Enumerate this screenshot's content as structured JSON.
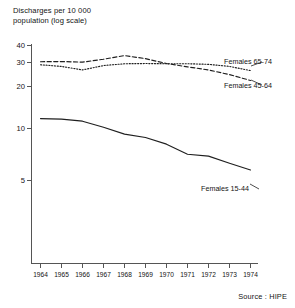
{
  "chart_data": {
    "type": "line",
    "title_line1": "Discharges per 10 000",
    "title_line2": "population (log scale)",
    "xlabel": "",
    "ylabel": "Discharges per 10 000 population (log scale)",
    "yscale": "log",
    "ylim": [
      3.2,
      45
    ],
    "ytick_labels": [
      "40",
      "30",
      "20",
      "10",
      "5"
    ],
    "ytick_values": [
      40,
      30,
      20,
      10,
      5
    ],
    "grid": false,
    "legend_position": "right-inline",
    "x": [
      1964,
      1965,
      1966,
      1967,
      1968,
      1969,
      1970,
      1971,
      1972,
      1973,
      1974
    ],
    "categories": [
      "1964",
      "1965",
      "1966",
      "1967",
      "1968",
      "1969",
      "1970",
      "1971",
      "1972",
      "1973",
      "1974"
    ],
    "series": [
      {
        "name": "Females 65-74",
        "style": "dotted",
        "values": [
          29.0,
          28.2,
          26.6,
          28.6,
          29.5,
          29.6,
          29.5,
          29.5,
          29.2,
          28.2,
          26.3
        ]
      },
      {
        "name": "Females 45-64",
        "style": "dashed",
        "values": [
          30.5,
          30.6,
          30.3,
          31.8,
          33.8,
          32.1,
          29.6,
          28.0,
          26.6,
          24.6,
          22.3
        ]
      },
      {
        "name": "Females 15-44",
        "style": "solid",
        "values": [
          11.8,
          11.7,
          11.3,
          10.2,
          9.1,
          8.6,
          7.7,
          6.5,
          6.3,
          5.6,
          5.0
        ]
      }
    ],
    "annotations": [
      {
        "text": "Females 65-74",
        "attached_series": "Females 65-74"
      },
      {
        "text": "Females 45-64",
        "attached_series": "Females 45-64"
      },
      {
        "text": "Females 15-44",
        "attached_series": "Females 15-44"
      }
    ],
    "source": "Source : HIPE"
  }
}
